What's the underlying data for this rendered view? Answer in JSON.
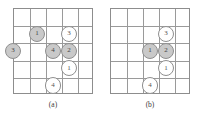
{
  "figure": {
    "width": 203,
    "height": 118,
    "background": "#ffffff",
    "grid_line_color": "#9a9a9a",
    "token_gray_fill": "#c9c9c9",
    "token_white_fill": "#ffffff",
    "token_border_color": "#8f8f8f"
  },
  "panels": [
    {
      "id": "panel-a",
      "caption": "(a)",
      "grid": {
        "rows": 5,
        "cols": 5,
        "x": 13,
        "y": 8,
        "width": 80,
        "height": 86
      },
      "tokens": [
        {
          "label": "1",
          "fill": "gray",
          "col": 1,
          "row": 1,
          "name": "token-a-1"
        },
        {
          "label": "3",
          "fill": "white",
          "col": 3,
          "row": 1,
          "name": "token-a-3-top"
        },
        {
          "label": "3",
          "fill": "gray",
          "col": -0.5,
          "row": 2,
          "name": "token-a-3-left"
        },
        {
          "label": "4",
          "fill": "gray",
          "col": 2,
          "row": 2,
          "name": "token-a-4"
        },
        {
          "label": "2",
          "fill": "gray",
          "col": 3,
          "row": 2,
          "name": "token-a-2"
        },
        {
          "label": "1",
          "fill": "white",
          "col": 3,
          "row": 3,
          "name": "token-a-1-lower"
        },
        {
          "label": "4",
          "fill": "white",
          "col": 2,
          "row": 4,
          "name": "token-a-4-bottom"
        }
      ]
    },
    {
      "id": "panel-b",
      "caption": "(b)",
      "grid": {
        "rows": 5,
        "cols": 5,
        "x": 110,
        "y": 8,
        "width": 80,
        "height": 86
      },
      "tokens": [
        {
          "label": "3",
          "fill": "white",
          "col": 3,
          "row": 1,
          "name": "token-b-3"
        },
        {
          "label": "1",
          "fill": "gray",
          "col": 2,
          "row": 2,
          "name": "token-b-1"
        },
        {
          "label": "2",
          "fill": "gray",
          "col": 3,
          "row": 2,
          "name": "token-b-2"
        },
        {
          "label": "1",
          "fill": "white",
          "col": 3,
          "row": 3,
          "name": "token-b-1-lower"
        },
        {
          "label": "4",
          "fill": "white",
          "col": 2,
          "row": 4,
          "name": "token-b-4"
        }
      ]
    }
  ],
  "captions": {
    "panel_a": "(a)",
    "panel_b": "(b)"
  }
}
